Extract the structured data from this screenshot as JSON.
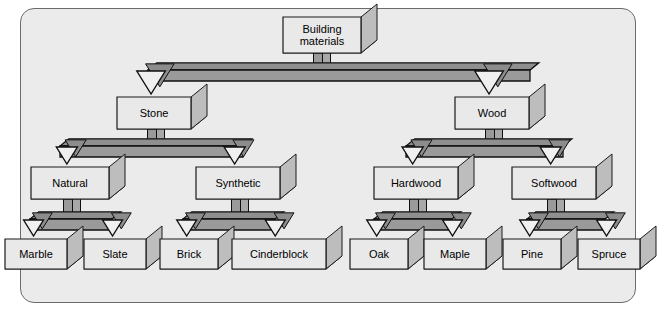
{
  "diagram": {
    "style": "isometric-3d-tree",
    "colors": {
      "page_background": "#ffffff",
      "frame_fill": "#ebebeb",
      "frame_stroke": "#6b6b6b",
      "box_front": "#e9e9e9",
      "box_side": "#bdbdbd",
      "box_bottom": "#c9c9c9",
      "box_stroke": "#1a1a1a",
      "connector_top": "#8f8f8f",
      "connector_front": "#9a9a9a",
      "connector_side": "#a8a8a8",
      "connector_stroke": "#101010",
      "arrow_fill": "#f0f0f0",
      "arrow_side": "#8c8c8c",
      "text": "#000000"
    },
    "levels": [
      {
        "level": 1,
        "nodes": [
          {
            "id": "building-materials",
            "label": "Building\nmaterials",
            "x": 283,
            "y": 17,
            "w": 78,
            "h": 36,
            "font": 11
          }
        ]
      },
      {
        "level": 2,
        "nodes": [
          {
            "id": "stone",
            "label": "Stone",
            "x": 117,
            "y": 97,
            "w": 74,
            "h": 32,
            "font": 11
          },
          {
            "id": "wood",
            "label": "Wood",
            "x": 455,
            "y": 97,
            "w": 74,
            "h": 32,
            "font": 11
          }
        ]
      },
      {
        "level": 3,
        "nodes": [
          {
            "id": "natural",
            "label": "Natural",
            "x": 31,
            "y": 167,
            "w": 78,
            "h": 32,
            "font": 11
          },
          {
            "id": "synthetic",
            "label": "Synthetic",
            "x": 196,
            "y": 167,
            "w": 84,
            "h": 32,
            "font": 11
          },
          {
            "id": "hardwood",
            "label": "Hardwood",
            "x": 374,
            "y": 167,
            "w": 84,
            "h": 32,
            "font": 11
          },
          {
            "id": "softwood",
            "label": "Softwood",
            "x": 512,
            "y": 167,
            "w": 84,
            "h": 32,
            "font": 11
          }
        ]
      },
      {
        "level": 4,
        "nodes": [
          {
            "id": "marble",
            "label": "Marble",
            "x": 5,
            "y": 239,
            "w": 62,
            "h": 30,
            "font": 11
          },
          {
            "id": "slate",
            "label": "Slate",
            "x": 84,
            "y": 239,
            "w": 62,
            "h": 30,
            "font": 11
          },
          {
            "id": "brick",
            "label": "Brick",
            "x": 160,
            "y": 239,
            "w": 58,
            "h": 30,
            "font": 11
          },
          {
            "id": "cinderblock",
            "label": "Cinderblock",
            "x": 232,
            "y": 239,
            "w": 94,
            "h": 30,
            "font": 11
          },
          {
            "id": "oak",
            "label": "Oak",
            "x": 350,
            "y": 239,
            "w": 58,
            "h": 30,
            "font": 11
          },
          {
            "id": "maple",
            "label": "Maple",
            "x": 424,
            "y": 239,
            "w": 62,
            "h": 30,
            "font": 11
          },
          {
            "id": "pine",
            "label": "Pine",
            "x": 503,
            "y": 239,
            "w": 58,
            "h": 30,
            "font": 11
          },
          {
            "id": "spruce",
            "label": "Spruce",
            "x": 578,
            "y": 239,
            "w": 62,
            "h": 30,
            "font": 11
          }
        ]
      }
    ],
    "edges": [
      {
        "from": "building-materials",
        "to": [
          "stone",
          "wood"
        ],
        "bar_y": 70,
        "bar_left": 148,
        "bar_right": 530,
        "stem_x": 318
      },
      {
        "from": "stone",
        "to": [
          "natural",
          "synthetic"
        ],
        "bar_y": 146,
        "bar_left": 60,
        "bar_right": 243,
        "stem_x": 152
      },
      {
        "from": "wood",
        "to": [
          "hardwood",
          "softwood"
        ],
        "bar_y": 146,
        "bar_left": 406,
        "bar_right": 563,
        "stem_x": 490
      },
      {
        "from": "natural",
        "to": [
          "marble",
          "slate"
        ],
        "bar_y": 219,
        "bar_left": 30,
        "bar_right": 112,
        "stem_x": 68
      },
      {
        "from": "synthetic",
        "to": [
          "brick",
          "cinderblock"
        ],
        "bar_y": 219,
        "bar_left": 183,
        "bar_right": 275,
        "stem_x": 236
      },
      {
        "from": "hardwood",
        "to": [
          "oak",
          "maple"
        ],
        "bar_y": 219,
        "bar_left": 374,
        "bar_right": 452,
        "stem_x": 414
      },
      {
        "from": "softwood",
        "to": [
          "pine",
          "spruce"
        ],
        "bar_y": 219,
        "bar_left": 527,
        "bar_right": 605,
        "stem_x": 552
      }
    ]
  }
}
